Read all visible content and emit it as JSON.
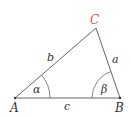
{
  "diagram": {
    "type": "triangle",
    "vertices": {
      "A": {
        "label": "A",
        "x": 15,
        "y": 98,
        "color": "#333333"
      },
      "B": {
        "label": "B",
        "x": 120,
        "y": 98,
        "color": "#333333"
      },
      "C": {
        "label": "C",
        "x": 96,
        "y": 28,
        "color": "#d9534f"
      }
    },
    "sides": {
      "a": {
        "label": "a"
      },
      "b": {
        "label": "b"
      },
      "c": {
        "label": "c"
      }
    },
    "angles": {
      "alpha": {
        "label": "α"
      },
      "beta": {
        "label": "β"
      }
    },
    "colors": {
      "line": "#666666",
      "text": "#333333",
      "highlight": "#d9534f"
    }
  }
}
